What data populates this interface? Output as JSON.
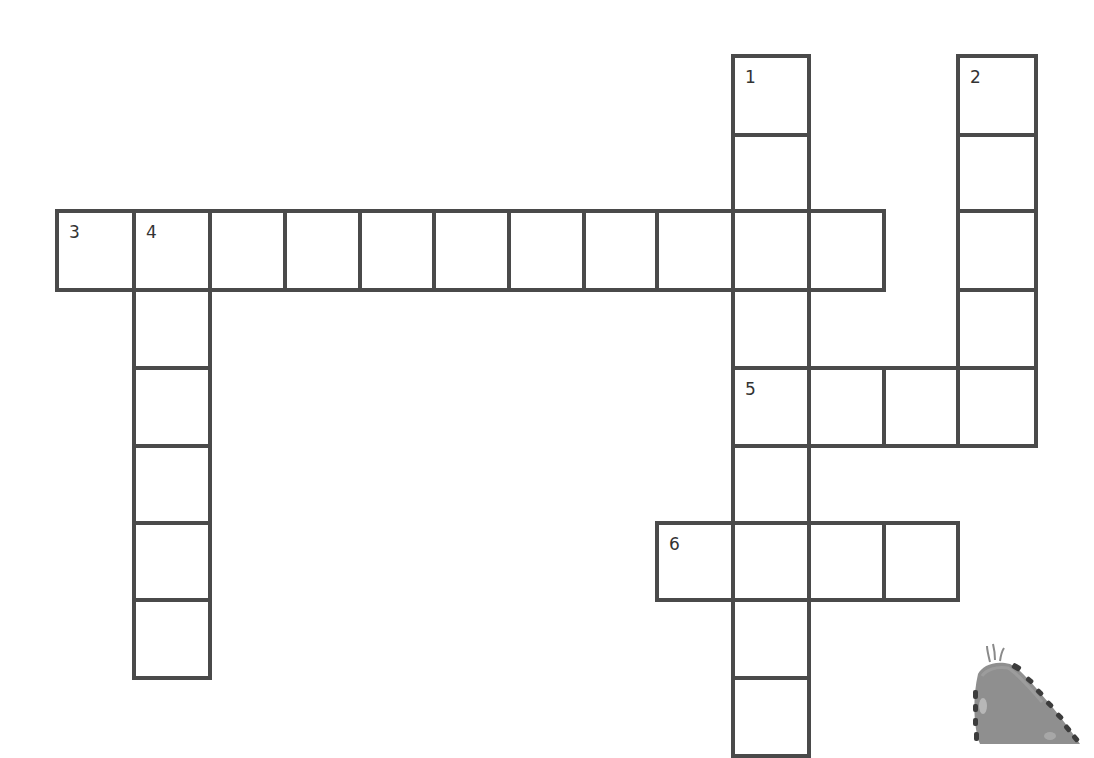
{
  "puzzle": {
    "type": "crossword",
    "line_color": "#4a4a4a",
    "background": "#ffffff",
    "grid": {
      "col_x": [
        57,
        134,
        210,
        285,
        360,
        434,
        509,
        584,
        657,
        733,
        809,
        884,
        958,
        1036
      ],
      "row_y": [
        56,
        135,
        211,
        290,
        368,
        446,
        523,
        600,
        678,
        756
      ]
    },
    "words": [
      {
        "number": "1",
        "direction": "down",
        "row": 0,
        "col": 9,
        "length": 9
      },
      {
        "number": "2",
        "direction": "down",
        "row": 0,
        "col": 12,
        "length": 5
      },
      {
        "number": "3",
        "direction": "across",
        "row": 2,
        "col": 0,
        "length": 11
      },
      {
        "number": "4",
        "direction": "down",
        "row": 2,
        "col": 1,
        "length": 6
      },
      {
        "number": "5",
        "direction": "across",
        "row": 4,
        "col": 9,
        "length": 4
      },
      {
        "number": "6",
        "direction": "across",
        "row": 6,
        "col": 8,
        "length": 4
      }
    ]
  },
  "decoration": {
    "name": "caterpillar-illustration",
    "body_color": "#8f8f8f",
    "spot_color": "#3c3c3c"
  }
}
